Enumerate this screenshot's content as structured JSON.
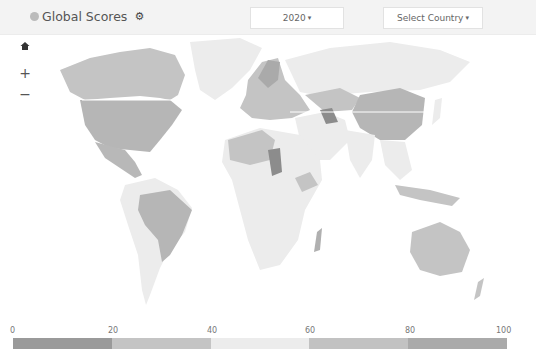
{
  "header": {
    "title": "Global Scores",
    "globe_icon": "globe-icon",
    "settings_icon": "gear-icon",
    "year_dropdown": {
      "value": "2020",
      "caret": "▾"
    },
    "country_dropdown": {
      "value": "Select Country",
      "caret": "▾"
    }
  },
  "map_controls": {
    "home": "⌂",
    "zoom_in": "+",
    "zoom_out": "−"
  },
  "legend": {
    "ticks": [
      "0",
      "20",
      "40",
      "60",
      "80",
      "100"
    ],
    "segments": [
      {
        "range": "0-20",
        "color": "#9a9a9a"
      },
      {
        "range": "20-40",
        "color": "#c4c4c4"
      },
      {
        "range": "40-60",
        "color": "#ececec"
      },
      {
        "range": "60-80",
        "color": "#c2c2c2"
      },
      {
        "range": "80-100",
        "color": "#aaaaaa"
      }
    ]
  },
  "map_colors": {
    "ocean": "#ffffff",
    "low": "#ececec",
    "mid": "#c4c4c4",
    "high": "#b0b0b0",
    "dark": "#8c8c8c"
  }
}
